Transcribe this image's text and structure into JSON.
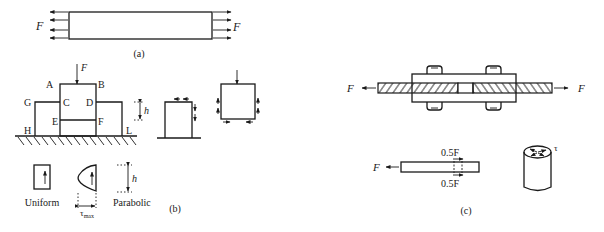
{
  "figure": {
    "panel_a": {
      "caption": "(a)",
      "force_left": "F",
      "force_right": "F",
      "description": "Bar under uniform axial tension"
    },
    "panel_b": {
      "caption": "(b)",
      "load": "F",
      "point_labels": {
        "A": "A",
        "B": "B",
        "C": "C",
        "D": "D",
        "E": "E",
        "F": "F",
        "G": "G",
        "H": "H",
        "L": "L"
      },
      "height_label": "h",
      "distribution_uniform": "Uniform",
      "distribution_parabolic": "Parabolic",
      "tau_max_label": "τ",
      "tau_max_sub": "max",
      "profile_height_label": "h"
    },
    "panel_c": {
      "caption": "(c)",
      "force_left": "F",
      "force_right": "F",
      "half_force_top": "0.5F",
      "half_force_bottom": "0.5F",
      "free_body_force": "F",
      "tau_label": "τ"
    }
  },
  "colors": {
    "ink": "#1a1a1a",
    "background": "#ffffff"
  }
}
